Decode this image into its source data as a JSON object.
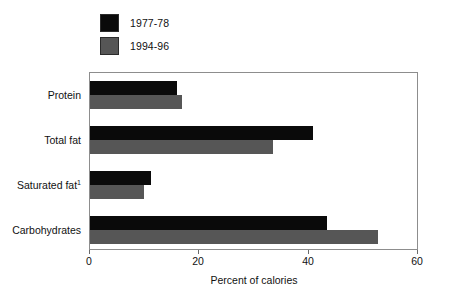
{
  "legend": {
    "items": [
      {
        "label": "1977-78",
        "color": "#0a0a0a",
        "swatch_name": "legend-swatch-1977"
      },
      {
        "label": "1994-96",
        "color": "#565656",
        "swatch_name": "legend-swatch-1994"
      }
    ]
  },
  "axis": {
    "x_title": "Percent of calories",
    "ticks": [
      "0",
      "20",
      "40",
      "60"
    ]
  },
  "categories": [
    {
      "label": "Protein",
      "footnote": ""
    },
    {
      "label": "Total fat",
      "footnote": ""
    },
    {
      "label": "Saturated fat",
      "footnote": "1"
    },
    {
      "label": "Carbohydrates",
      "footnote": ""
    }
  ],
  "chart_data": {
    "type": "bar",
    "orientation": "horizontal",
    "title": "",
    "xlabel": "Percent of calories",
    "ylabel": "",
    "xlim": [
      0,
      60
    ],
    "xticks": [
      0,
      20,
      40,
      60
    ],
    "grid": false,
    "legend_position": "top-left",
    "categories": [
      "Protein",
      "Total fat",
      "Saturated fat",
      "Carbohydrates"
    ],
    "series": [
      {
        "name": "1977-78",
        "color": "#0a0a0a",
        "values": [
          16.0,
          41.0,
          11.2,
          43.4
        ]
      },
      {
        "name": "1994-96",
        "color": "#565656",
        "values": [
          16.8,
          33.6,
          9.9,
          52.8
        ]
      }
    ],
    "footnotes": [
      "1"
    ]
  }
}
